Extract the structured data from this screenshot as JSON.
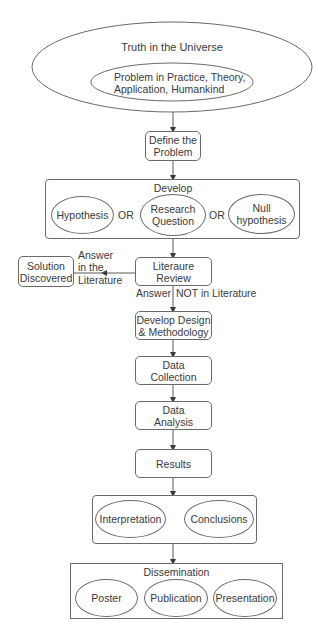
{
  "diagram": {
    "universe": {
      "title": "Truth in the Universe",
      "inner_line1": "Problem in Practice, Theory,",
      "inner_line2": "Application, Humankind"
    },
    "define": {
      "line1": "Define the",
      "line2": "Problem"
    },
    "develop": {
      "title": "Develop",
      "hypothesis": "Hypothesis",
      "or1": "OR",
      "research_line1": "Research",
      "research_line2": "Question",
      "or2": "OR",
      "null_line1": "Null",
      "null_line2": "hypothesis"
    },
    "literature": {
      "line1": "Literaure",
      "line2": "Review"
    },
    "solution": {
      "line1": "Solution",
      "line2": "Discovered"
    },
    "answer_in": {
      "line1": "Answer",
      "line2": "in the",
      "line3": "Literature"
    },
    "answer_not": {
      "left": "Answer",
      "right": "NOT in Literature"
    },
    "design": {
      "line1": "Develop Design",
      "line2": "& Methodology"
    },
    "collection": {
      "line1": "Data",
      "line2": "Collection"
    },
    "analysis": {
      "line1": "Data",
      "line2": "Analysis"
    },
    "results": {
      "label": "Results"
    },
    "interp_group": {
      "interpretation": "Interpretation",
      "conclusions": "Conclusions"
    },
    "dissemination": {
      "title": "Dissemination",
      "poster": "Poster",
      "publication": "Publication",
      "presentation": "Presentation"
    },
    "colors": {
      "stroke": "#6a6a6a",
      "text": "#3a3a3a",
      "background": "#ffffff"
    }
  }
}
